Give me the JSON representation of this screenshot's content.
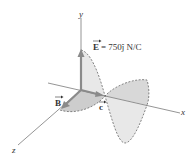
{
  "diagram": {
    "axes": {
      "x_label": "x",
      "y_label": "y",
      "z_label": "z"
    },
    "vectors": {
      "E": {
        "symbol": "E",
        "equation": "= 750ĵ N/C",
        "color": "#8a8a8a"
      },
      "B": {
        "symbol": "B",
        "color": "#8a8a8a"
      },
      "c": {
        "symbol": "c",
        "color": "#8a8a8a"
      }
    },
    "colors": {
      "axis": "#7a7a7a",
      "e_wave_fill": "#e6e6e6",
      "b_wave_fill": "#cfcfcf",
      "dash": "#555555"
    }
  }
}
